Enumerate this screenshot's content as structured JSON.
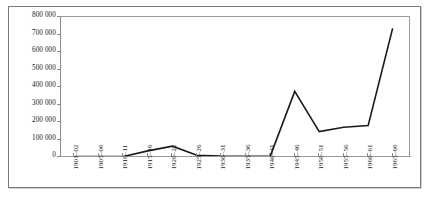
{
  "chart_data": {
    "type": "line",
    "title": "",
    "subtitle": "",
    "xlabel": "",
    "ylabel": "",
    "categories": [
      "1901–02",
      "1905–06",
      "1910–11",
      "1915–16",
      "1920–21",
      "1925–26",
      "1930–31",
      "1935–36",
      "1940–41",
      "1945–46",
      "1950–51",
      "1955–56",
      "1960–61",
      "1965–66"
    ],
    "values": [
      2000,
      2000,
      3000,
      35000,
      62000,
      10000,
      5000,
      4000,
      5000,
      375000,
      145000,
      170000,
      180000,
      735000
    ],
    "series": [
      {
        "name": "Series 1",
        "values": [
          2000,
          2000,
          3000,
          35000,
          62000,
          10000,
          5000,
          4000,
          5000,
          375000,
          145000,
          170000,
          180000,
          735000
        ]
      }
    ],
    "ylim": [
      0,
      800000
    ],
    "yticks": [
      0,
      100000,
      200000,
      300000,
      400000,
      500000,
      600000,
      700000,
      800000
    ],
    "ytick_labels": [
      "0",
      "100 000",
      "200 000",
      "300 000",
      "400 000",
      "500 000",
      "600 000",
      "700 000",
      "800 000"
    ],
    "grid": false,
    "legend": false,
    "legend_position": "none",
    "line_color": "#1a1a1a",
    "line_width": 1.6,
    "markers": false,
    "axis_color": "#8a8a8a",
    "background_color": "#ffffff",
    "frame": true
  }
}
